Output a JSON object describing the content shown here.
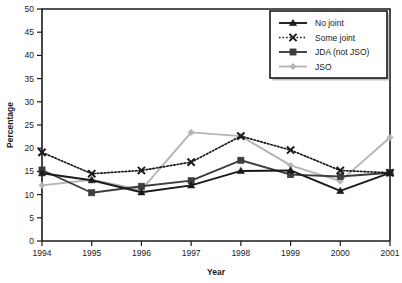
{
  "chart_data": {
    "type": "line",
    "title": "",
    "xlabel": "Year",
    "ylabel": "Percentage",
    "categories": [
      1994,
      1995,
      1996,
      1997,
      1998,
      1999,
      2000,
      2001
    ],
    "xlim": [
      1994,
      2001
    ],
    "ylim": [
      0,
      50
    ],
    "yticks": [
      0,
      5,
      10,
      15,
      20,
      25,
      30,
      35,
      40,
      45,
      50
    ],
    "xticks": [
      "1994",
      "1995",
      "1996",
      "1997",
      "1998",
      "1999",
      "2000",
      "2001"
    ],
    "grid": false,
    "legend_position": "top-right",
    "series": [
      {
        "name": "No joint",
        "marker": "triangle",
        "line": "solid",
        "color": "#1a1a1a",
        "values": [
          14.6,
          13.1,
          10.5,
          12.0,
          15.1,
          15.2,
          10.8,
          14.7
        ]
      },
      {
        "name": "Some joint",
        "marker": "cross",
        "line": "dotted",
        "color": "#1a1a1a",
        "values": [
          19.1,
          14.5,
          15.2,
          17.0,
          22.6,
          19.6,
          15.2,
          14.7
        ]
      },
      {
        "name": "JDA (not JSO)",
        "marker": "square",
        "line": "solid",
        "color": "#3d3d3d",
        "values": [
          15.3,
          10.4,
          11.8,
          13.0,
          17.4,
          14.3,
          13.9,
          14.7
        ]
      },
      {
        "name": "JSO",
        "marker": "diamond",
        "line": "solid",
        "color": "#b5b5b5",
        "values": [
          12.0,
          13.2,
          11.0,
          23.4,
          22.6,
          16.3,
          12.9,
          22.3
        ]
      }
    ]
  },
  "legend": {
    "items": [
      {
        "label": "No joint"
      },
      {
        "label": "Some joint"
      },
      {
        "label": "JDA (not JSO)"
      },
      {
        "label": "JSO"
      }
    ]
  }
}
